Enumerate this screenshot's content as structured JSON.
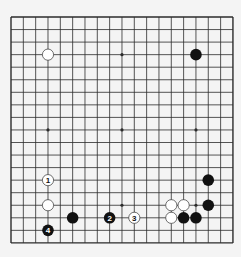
{
  "board": {
    "size": 19,
    "origin_x": 11,
    "origin_y": 17,
    "spacing_x": 12.33,
    "spacing_y": 12.55,
    "colors": {
      "background": "#f4f4f4",
      "line": "#2b2b2b",
      "black_stone": "#111111",
      "white_stone": "#ffffff",
      "white_stone_border": "#333333"
    },
    "star_points": [
      [
        3,
        3
      ],
      [
        9,
        3
      ],
      [
        15,
        3
      ],
      [
        3,
        9
      ],
      [
        9,
        9
      ],
      [
        15,
        9
      ],
      [
        3,
        15
      ],
      [
        9,
        15
      ],
      [
        15,
        15
      ]
    ]
  },
  "stones": [
    {
      "color": "white",
      "col": 3,
      "row": 3,
      "label": ""
    },
    {
      "color": "black",
      "col": 15,
      "row": 3,
      "label": ""
    },
    {
      "color": "white",
      "col": 3,
      "row": 13,
      "label": "1"
    },
    {
      "color": "white",
      "col": 3,
      "row": 15,
      "label": ""
    },
    {
      "color": "black",
      "col": 5,
      "row": 16,
      "label": ""
    },
    {
      "color": "black",
      "col": 8,
      "row": 16,
      "label": "2"
    },
    {
      "color": "white",
      "col": 10,
      "row": 16,
      "label": "3"
    },
    {
      "color": "black",
      "col": 3,
      "row": 17,
      "label": "4"
    },
    {
      "color": "white",
      "col": 13,
      "row": 15,
      "label": ""
    },
    {
      "color": "white",
      "col": 14,
      "row": 15,
      "label": ""
    },
    {
      "color": "white",
      "col": 13,
      "row": 16,
      "label": ""
    },
    {
      "color": "black",
      "col": 14,
      "row": 16,
      "label": ""
    },
    {
      "color": "black",
      "col": 15,
      "row": 16,
      "label": ""
    },
    {
      "color": "black",
      "col": 16,
      "row": 15,
      "label": ""
    },
    {
      "color": "black",
      "col": 16,
      "row": 13,
      "label": ""
    }
  ]
}
